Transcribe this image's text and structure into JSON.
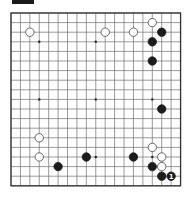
{
  "diagram": {
    "label_box": "",
    "board_size": 19,
    "colors": {
      "black": "#1c1c1c",
      "white": "#ffffff",
      "line": "#6e6e6e",
      "border": "#333333"
    },
    "star_points": [
      [
        3,
        3
      ],
      [
        9,
        3
      ],
      [
        15,
        3
      ],
      [
        3,
        9
      ],
      [
        9,
        9
      ],
      [
        15,
        9
      ],
      [
        3,
        15
      ],
      [
        9,
        15
      ],
      [
        15,
        15
      ]
    ],
    "stones": [
      {
        "color": "white",
        "col": 15,
        "row": 1
      },
      {
        "color": "white",
        "col": 2,
        "row": 2
      },
      {
        "color": "white",
        "col": 10,
        "row": 2
      },
      {
        "color": "white",
        "col": 13,
        "row": 2
      },
      {
        "color": "black",
        "col": 16,
        "row": 2
      },
      {
        "color": "black",
        "col": 15,
        "row": 3
      },
      {
        "color": "black",
        "col": 15,
        "row": 5
      },
      {
        "color": "black",
        "col": 16,
        "row": 10
      },
      {
        "color": "white",
        "col": 3,
        "row": 13
      },
      {
        "color": "white",
        "col": 15,
        "row": 14
      },
      {
        "color": "white",
        "col": 3,
        "row": 15
      },
      {
        "color": "black",
        "col": 8,
        "row": 15
      },
      {
        "color": "black",
        "col": 13,
        "row": 15
      },
      {
        "color": "white",
        "col": 16,
        "row": 15
      },
      {
        "color": "black",
        "col": 5,
        "row": 16
      },
      {
        "color": "black",
        "col": 15,
        "row": 16
      },
      {
        "color": "white",
        "col": 16,
        "row": 16
      },
      {
        "color": "black",
        "col": 16,
        "row": 17
      },
      {
        "color": "black",
        "col": 17,
        "row": 17,
        "label": "1"
      }
    ]
  }
}
